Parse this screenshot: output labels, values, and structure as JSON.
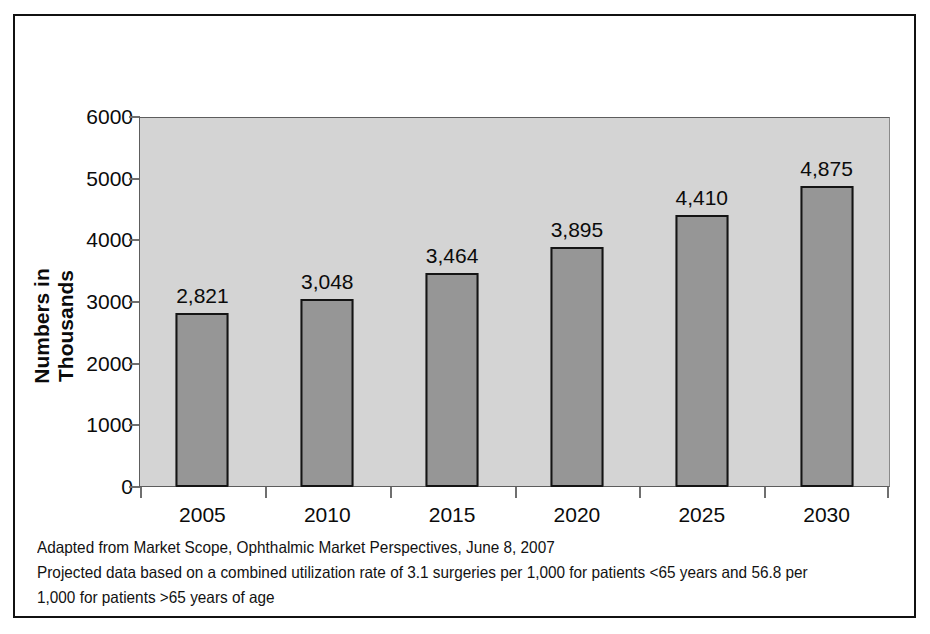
{
  "chart_data": {
    "type": "bar",
    "title": "",
    "xlabel": "",
    "ylabel": "Numbers in Thousands",
    "categories": [
      "2005",
      "2010",
      "2015",
      "2020",
      "2025",
      "2030"
    ],
    "values": [
      2821,
      3048,
      3464,
      3895,
      4410,
      4875
    ],
    "data_labels": [
      "2,821",
      "3,048",
      "3,464",
      "3,895",
      "4,410",
      "4,875"
    ],
    "ylim": [
      0,
      6000
    ],
    "ytick_values": [
      0,
      1000,
      2000,
      3000,
      4000,
      5000,
      6000
    ],
    "ytick_labels": [
      "0",
      "1000",
      "2000",
      "3000",
      "4000",
      "5000",
      "6000"
    ],
    "grid": false,
    "legend": "none",
    "series": [
      {
        "name": "Projected cataract surgeries",
        "values": [
          2821,
          3048,
          3464,
          3895,
          4410,
          4875
        ]
      }
    ],
    "colors": {
      "bar_fill": "#969696",
      "bar_border": "#141414",
      "plot_background": "#d4d4d4",
      "figure_background": "#ffffff",
      "frame_border": "#111111",
      "text": "#0b0b0b"
    },
    "annotations": [
      "Adapted from Market Scope, Ophthalmic Market Perspectives, June 8, 2007",
      "Projected data based on a combined utilization rate of 3.1 surgeries per 1,000 for patients <65 years and 56.8 per",
      "1,000 for patients >65 years of age"
    ]
  },
  "footnotes": {
    "line1": "Adapted from Market Scope, Ophthalmic Market Perspectives, June 8, 2007",
    "line2": "Projected data based on a combined utilization rate of 3.1 surgeries per 1,000 for patients <65 years and 56.8 per",
    "line3": "1,000 for patients >65 years of age"
  }
}
